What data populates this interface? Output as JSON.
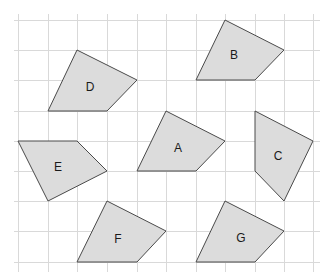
{
  "diagram": {
    "type": "quadrilaterals-on-grid",
    "grid": {
      "x_lines": [
        18,
        48,
        77,
        107,
        137,
        166,
        196,
        225,
        255,
        284,
        313
      ],
      "y_lines": [
        20,
        50,
        80,
        111,
        141,
        171,
        201,
        231,
        262
      ],
      "x_extent": [
        14,
        320
      ],
      "y_extent": [
        14,
        272
      ],
      "color": "#d9d9d9"
    },
    "fill_color": "#dcdcdc",
    "stroke_color": "#4a4a4a",
    "shapes": [
      {
        "id": "A",
        "label": "A",
        "points": [
          [
            166,
            111
          ],
          [
            225,
            141
          ],
          [
            196,
            171
          ],
          [
            137,
            171
          ]
        ],
        "label_pos": [
          178,
          149
        ]
      },
      {
        "id": "B",
        "label": "B",
        "points": [
          [
            225,
            20
          ],
          [
            284,
            50
          ],
          [
            255,
            80
          ],
          [
            196,
            80
          ]
        ],
        "label_pos": [
          234,
          56
        ]
      },
      {
        "id": "C",
        "label": "C",
        "points": [
          [
            255,
            111
          ],
          [
            313,
            141
          ],
          [
            284,
            201
          ],
          [
            255,
            171
          ]
        ],
        "label_pos": [
          278,
          157
        ]
      },
      {
        "id": "D",
        "label": "D",
        "points": [
          [
            77,
            50
          ],
          [
            137,
            80
          ],
          [
            107,
            111
          ],
          [
            48,
            111
          ]
        ],
        "label_pos": [
          90,
          88
        ]
      },
      {
        "id": "E",
        "label": "E",
        "points": [
          [
            18,
            141
          ],
          [
            77,
            141
          ],
          [
            107,
            171
          ],
          [
            48,
            201
          ]
        ],
        "label_pos": [
          58,
          168
        ]
      },
      {
        "id": "F",
        "label": "F",
        "points": [
          [
            107,
            201
          ],
          [
            166,
            231
          ],
          [
            137,
            262
          ],
          [
            77,
            262
          ]
        ],
        "label_pos": [
          118,
          240
        ]
      },
      {
        "id": "G",
        "label": "G",
        "points": [
          [
            225,
            201
          ],
          [
            284,
            231
          ],
          [
            255,
            262
          ],
          [
            196,
            262
          ]
        ],
        "label_pos": [
          241,
          239
        ]
      }
    ]
  }
}
